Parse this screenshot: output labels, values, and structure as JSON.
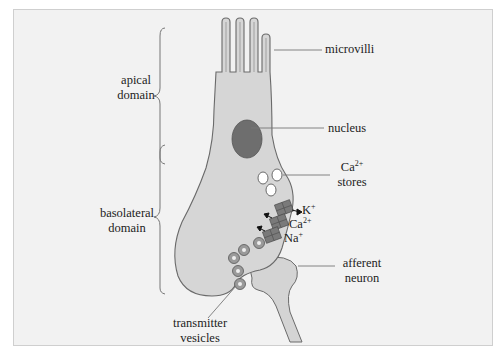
{
  "figure": {
    "colors": {
      "background": "#f2f2f2",
      "cell_fill": "#d4d4d4",
      "outline": "#6a6a6a",
      "nucleus": "#6e6e6e",
      "channel": "#7a7a7a",
      "text": "#222222"
    },
    "brackets": [
      {
        "label_line1": "apical",
        "label_line2": "domain"
      },
      {
        "label_line1": "basolateral",
        "label_line2": "domain"
      }
    ],
    "labels": {
      "microvilli": "microvilli",
      "nucleus": "nucleus",
      "ca_stores_ion": "Ca",
      "ca_stores_charge": "2+",
      "ca_stores_word": "stores",
      "k_ion": "K",
      "k_charge": "+",
      "ca_ion": "Ca",
      "ca_charge": "2+",
      "na_ion": "Na",
      "na_charge": "+",
      "afferent_line1": "afferent",
      "afferent_line2": "neuron",
      "vesicles_line1": "transmitter",
      "vesicles_line2": "vesicles"
    }
  }
}
